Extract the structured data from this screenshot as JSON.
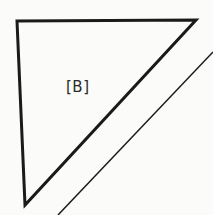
{
  "diagram": {
    "triangle": {
      "label": "[B]",
      "vertices": [
        [
          17,
          21
        ],
        [
          196,
          20
        ],
        [
          25,
          205
        ]
      ],
      "stroke": "#1a1a1a",
      "stroke_width": 3
    },
    "parallel_line": {
      "from": [
        213,
        52
      ],
      "to": [
        58,
        215
      ],
      "stroke": "#1a1a1a",
      "stroke_width": 1.5
    },
    "background": "#fbfbf9"
  }
}
